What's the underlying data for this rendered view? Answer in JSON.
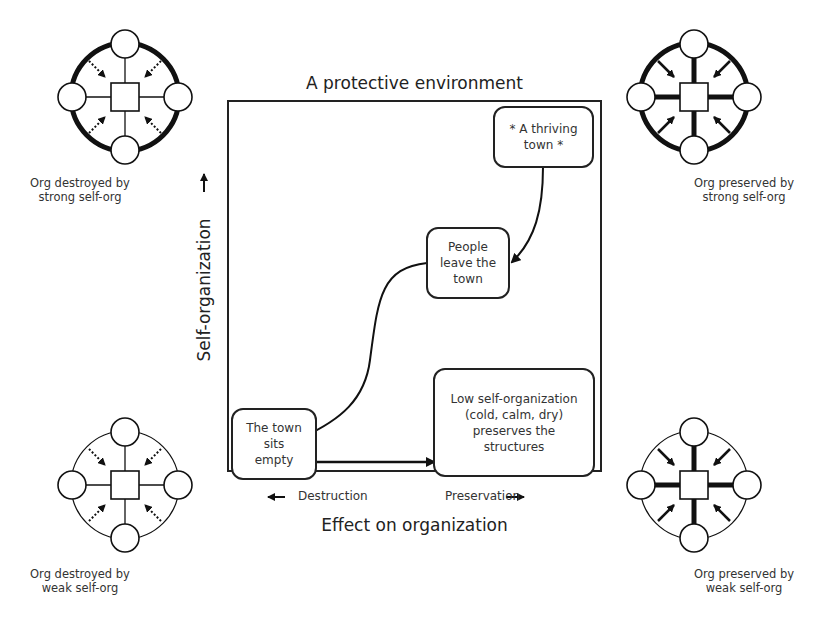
{
  "title": "A protective environment",
  "x_axis": {
    "label": "Effect on organization",
    "left_label": "Destruction",
    "right_label": "Preservation"
  },
  "y_axis": {
    "label": "Self-organization"
  },
  "boxes": {
    "thriving": "* A thriving\ntown *",
    "leave": "People\nleave the\ntown",
    "empty": "The town\nsits\nempty",
    "low": "Low self-organization\n(cold, calm, dry)\npreserves the\nstructures"
  },
  "icons": {
    "top_left": {
      "caption_line1": "Org destroyed by",
      "caption_line2": "strong self-org"
    },
    "top_right": {
      "caption_line1": "Org preserved by",
      "caption_line2": "strong self-org"
    },
    "bottom_left": {
      "caption_line1": "Org destroyed by",
      "caption_line2": "weak self-org"
    },
    "bottom_right": {
      "caption_line1": "Org preserved by",
      "caption_line2": "weak self-org"
    }
  }
}
